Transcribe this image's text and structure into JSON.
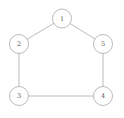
{
  "diagram": {
    "name": "pentagon-cycle-graph",
    "background": "#ffffff",
    "node_fill": "#ffffff",
    "node_stroke": "#a9a9a9",
    "edge_color": "#a9a9a9",
    "label_color": "#5a5a5a",
    "node_radius": 9.5,
    "stroke_width": 0.8,
    "canvas": {
      "width": 124,
      "height": 118
    },
    "nodes": [
      {
        "id": "1",
        "label": "1",
        "x": 62,
        "y": 18.5
      },
      {
        "id": "2",
        "label": "2",
        "x": 19,
        "y": 44
      },
      {
        "id": "3",
        "label": "3",
        "x": 19,
        "y": 96
      },
      {
        "id": "4",
        "label": "4",
        "x": 103,
        "y": 96
      },
      {
        "id": "5",
        "label": "5",
        "x": 103,
        "y": 44
      }
    ],
    "edges": [
      {
        "from": "1",
        "to": "2"
      },
      {
        "from": "1",
        "to": "5"
      },
      {
        "from": "2",
        "to": "3"
      },
      {
        "from": "3",
        "to": "4"
      },
      {
        "from": "4",
        "to": "5"
      }
    ]
  }
}
